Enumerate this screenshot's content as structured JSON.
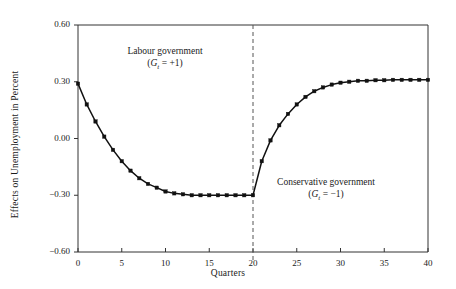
{
  "chart_data": {
    "type": "line",
    "title": "",
    "xlabel": "Quarters",
    "ylabel": "Effects on Unemployment in Percent",
    "xlim": [
      0,
      40
    ],
    "ylim": [
      -0.6,
      0.6
    ],
    "xticks": [
      0,
      5,
      10,
      15,
      20,
      25,
      30,
      35,
      40
    ],
    "xtick_labels": [
      "0",
      "5",
      "10",
      "15",
      "20",
      "25",
      "30",
      "35",
      "40"
    ],
    "yticks": [
      -0.6,
      -0.3,
      0.0,
      0.3,
      0.6
    ],
    "ytick_labels": [
      "−0.60",
      "−0.30",
      "0.00",
      "0.30",
      "0.60"
    ],
    "grid": false,
    "legend": "none",
    "marker": "filled-square",
    "series": [
      {
        "name": "Effect on unemployment",
        "x": [
          0,
          1,
          2,
          3,
          4,
          5,
          6,
          7,
          8,
          9,
          10,
          11,
          12,
          13,
          14,
          15,
          16,
          17,
          18,
          19,
          20,
          21,
          22,
          23,
          24,
          25,
          26,
          27,
          28,
          29,
          30,
          31,
          32,
          33,
          34,
          35,
          36,
          37,
          38,
          39,
          40
        ],
        "values": [
          0.29,
          0.18,
          0.09,
          0.01,
          -0.06,
          -0.12,
          -0.17,
          -0.21,
          -0.24,
          -0.26,
          -0.28,
          -0.29,
          -0.295,
          -0.3,
          -0.3,
          -0.3,
          -0.3,
          -0.3,
          -0.3,
          -0.3,
          -0.3,
          -0.12,
          -0.01,
          0.07,
          0.13,
          0.18,
          0.22,
          0.25,
          0.27,
          0.285,
          0.295,
          0.3,
          0.305,
          0.305,
          0.308,
          0.308,
          0.31,
          0.31,
          0.31,
          0.31,
          0.31
        ]
      }
    ],
    "annotations": [
      {
        "id": "labour",
        "line1": "Labour government",
        "line2_prefix": "(",
        "line2_var": "G",
        "line2_sub": "t",
        "line2_rest": " = +1)",
        "x": 10.6,
        "y": 0.4
      },
      {
        "id": "conservative",
        "line1": "Conservative government",
        "line2_prefix": "(",
        "line2_var": "G",
        "line2_sub": "t",
        "line2_rest": " = −1)",
        "x": 29.5,
        "y": -0.29
      }
    ],
    "vertical_reference_line": {
      "x": 20,
      "style": "dashed",
      "color": "#555555"
    },
    "colors": {
      "line": "#111111",
      "marker": "#111111",
      "axis": "#333333",
      "dashed_line": "#555555",
      "background": "#ffffff"
    }
  }
}
